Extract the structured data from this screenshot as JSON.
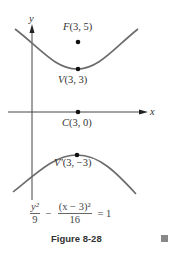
{
  "figure": {
    "axes": {
      "x_label": "x",
      "y_label": "y"
    },
    "points": [
      {
        "id": "focus",
        "label_prefix": "F",
        "label_coords": "(3, 5)"
      },
      {
        "id": "vertex",
        "label_prefix": "V",
        "label_coords": "(3, 3)"
      },
      {
        "id": "center",
        "label_prefix": "C",
        "label_coords": "(3, 0)"
      },
      {
        "id": "vertex-prime",
        "label_prefix": "V′",
        "label_coords": "(3, −3)"
      }
    ],
    "equation": {
      "term1_num": "y²",
      "term1_den": "9",
      "minus": "−",
      "term2_num": "(x − 3)²",
      "term2_den": "16",
      "equals": "= 1"
    },
    "caption": "Figure 8-28",
    "colors": {
      "curve": "#6b6b6b",
      "axis": "#444444",
      "dot": "#111111",
      "end_mark": "#888888"
    }
  }
}
